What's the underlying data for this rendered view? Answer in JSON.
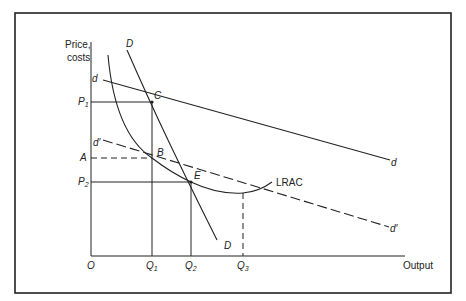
{
  "diagram": {
    "type": "economics-cost-demand-diagram",
    "axes": {
      "y_label_line1": "Price,",
      "y_label_line2": "costs",
      "x_label": "Output",
      "origin": "O"
    },
    "price_levels": {
      "p1": {
        "letter": "P",
        "sub": "1"
      },
      "a": "A",
      "p2": {
        "letter": "P",
        "sub": "2"
      }
    },
    "quantities": {
      "q1": {
        "letter": "Q",
        "sub": "1"
      },
      "q2": {
        "letter": "Q",
        "sub": "2"
      },
      "q3": {
        "letter": "Q",
        "sub": "3"
      }
    },
    "points": {
      "c": "C",
      "b": "B",
      "e": "E"
    },
    "curves": {
      "market_demand_top": "D",
      "market_demand_bottom": "D",
      "firm_demand_left": "d",
      "firm_demand_right": "d",
      "shifted_demand_left": "d′",
      "shifted_demand_right": "d′",
      "lrac": "LRAC"
    },
    "colors": {
      "line": "#222222",
      "frame": "#222222",
      "background": "#ffffff"
    }
  }
}
